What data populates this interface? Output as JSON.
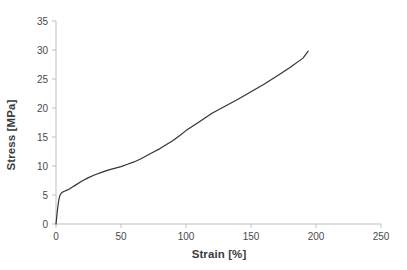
{
  "chart_data": {
    "type": "line",
    "title": "",
    "subtitle": "",
    "xlabel": "Strain [%]",
    "ylabel": "Stress [MPa]",
    "xlim": [
      0,
      250
    ],
    "ylim": [
      0,
      35
    ],
    "xticks": [
      0,
      50,
      100,
      150,
      200,
      250
    ],
    "yticks": [
      0,
      5,
      10,
      15,
      20,
      25,
      30,
      35
    ],
    "grid": false,
    "legend": null,
    "legend_position": "none",
    "series": [
      {
        "name": "Stress-strain curve",
        "color": "#333333",
        "line_width": 1.2,
        "x": [
          0,
          0.5,
          1,
          1.5,
          2,
          2.5,
          3,
          4,
          5,
          6,
          7,
          8,
          10,
          12,
          15,
          20,
          25,
          30,
          35,
          40,
          45,
          50,
          55,
          60,
          65,
          70,
          75,
          80,
          85,
          90,
          95,
          100,
          110,
          120,
          130,
          140,
          150,
          160,
          170,
          180,
          190,
          194
        ],
        "y": [
          0,
          1.1,
          2.2,
          3.1,
          3.9,
          4.5,
          4.9,
          5.3,
          5.5,
          5.6,
          5.7,
          5.8,
          6.0,
          6.3,
          6.7,
          7.4,
          8.0,
          8.5,
          8.9,
          9.3,
          9.6,
          9.9,
          10.3,
          10.7,
          11.2,
          11.8,
          12.4,
          13.0,
          13.7,
          14.4,
          15.2,
          16.1,
          17.6,
          19.1,
          20.3,
          21.5,
          22.8,
          24.1,
          25.5,
          27.0,
          28.6,
          29.8
        ]
      }
    ],
    "annotations": [],
    "notes": {
      "yield_stress": 5.5,
      "yield_strain": 4,
      "max_stress": 29.8,
      "max_strain": 194
    }
  },
  "axis_style": {
    "axis_color": "#bfbfbf",
    "tick_color": "#bfbfbf",
    "text_color": "#4a4a4a",
    "background": "#ffffff"
  }
}
